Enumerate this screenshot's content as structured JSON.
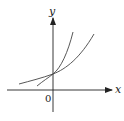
{
  "diagram": {
    "type": "coordinate-plane",
    "axes": {
      "x_label": "x",
      "y_label": "y",
      "origin_label": "0"
    },
    "colors": {
      "axis": "#222222",
      "curve": "#444444",
      "background": "#ffffff"
    },
    "curves": [
      {
        "name": "steeper-curve",
        "description": "steeper exponential, rises faster to the right"
      },
      {
        "name": "gentler-curve",
        "description": "gentler exponential, flatter on both sides"
      }
    ],
    "intersection": "point on positive y-axis"
  }
}
